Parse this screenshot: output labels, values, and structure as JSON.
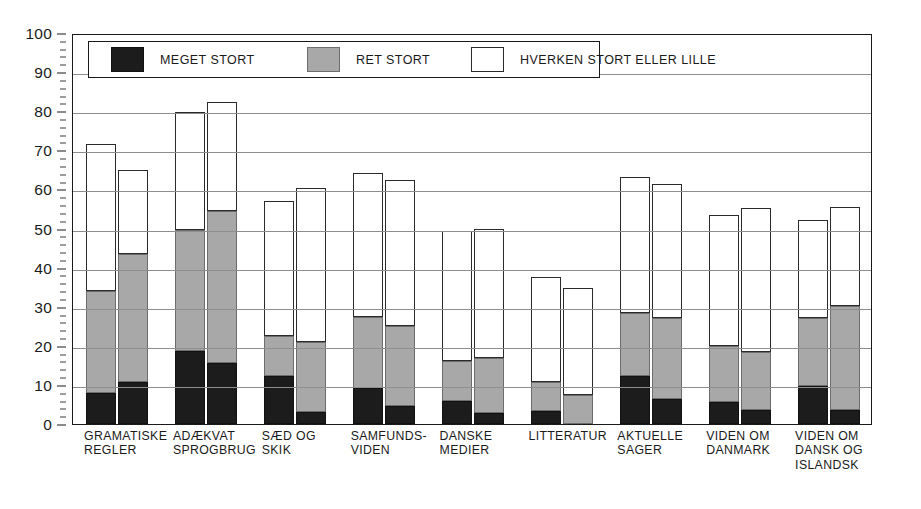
{
  "legend": {
    "items": [
      {
        "label": "MEGET STORT",
        "color": "#1c1c1c",
        "key": "black"
      },
      {
        "label": "RET STORT",
        "color": "#a8a8a8",
        "key": "gray"
      },
      {
        "label": "HVERKEN STORT ELLER LILLE",
        "color": "#ffffff",
        "key": "white"
      }
    ]
  },
  "axis": {
    "y_ticks": [
      0,
      10,
      20,
      30,
      40,
      50,
      60,
      70,
      80,
      90,
      100
    ],
    "y_minor_step": 2
  },
  "chart_data": {
    "type": "bar",
    "stacked": true,
    "grouped": true,
    "title": "",
    "subtitle": "",
    "xlabel": "",
    "ylabel": "",
    "ylim": [
      0,
      100
    ],
    "grid": true,
    "legend_position": "top-left-inside",
    "categories": [
      "GRAMATISKE REGLER",
      "ADÆKVAT SPROGBRUG",
      "SÆD OG SKIK",
      "SAMFUNDS-VIDEN",
      "DANSKE MEDIER",
      "LITTERATUR",
      "AKTUELLE SAGER",
      "VIDEN OM DANMARK",
      "VIDEN OM DANSK OG ISLANDSK"
    ],
    "category_label_lines": [
      [
        "GRAMATISKE",
        "REGLER"
      ],
      [
        "ADÆKVAT",
        "SPROGBRUG"
      ],
      [
        "SÆD OG",
        "SKIK"
      ],
      [
        "SAMFUNDS-",
        "VIDEN"
      ],
      [
        "DANSKE",
        "MEDIER"
      ],
      [
        "LITTERATUR"
      ],
      [
        "AKTUELLE",
        "SAGER"
      ],
      [
        "VIDEN OM",
        "DANMARK"
      ],
      [
        "VIDEN OM",
        "DANSK OG",
        "ISLANDSK"
      ]
    ],
    "series": [
      {
        "name": "MEGET STORT",
        "key": "black",
        "color": "#1c1c1c",
        "bar_a": [
          8.0,
          18.7,
          12.3,
          9.3,
          6.0,
          3.3,
          12.2,
          5.6,
          9.7
        ],
        "bar_b": [
          10.8,
          15.5,
          3.0,
          4.5,
          2.8,
          0.0,
          6.3,
          3.5,
          3.7
        ]
      },
      {
        "name": "RET STORT",
        "key": "gray",
        "color": "#a8a8a8",
        "bar_a": [
          26.0,
          31.0,
          10.2,
          18.0,
          10.0,
          7.4,
          16.1,
          14.4,
          17.3
        ],
        "bar_b": [
          32.7,
          39.0,
          18.0,
          20.5,
          14.0,
          7.5,
          20.7,
          14.8,
          26.5
        ]
      },
      {
        "name": "HVERKEN STORT ELLER LILLE",
        "key": "white",
        "color": "#ffffff",
        "bar_a": [
          37.5,
          30.0,
          34.5,
          37.0,
          33.3,
          27.0,
          34.9,
          33.5,
          25.3
        ],
        "bar_b": [
          21.5,
          27.8,
          39.3,
          37.5,
          33.2,
          27.3,
          34.3,
          36.9,
          25.3
        ]
      }
    ],
    "cumulative_tops": {
      "bar_a_black": [
        8.0,
        18.7,
        12.3,
        9.3,
        6.0,
        3.3,
        12.2,
        5.6,
        9.7
      ],
      "bar_a_gray": [
        34.0,
        49.7,
        22.5,
        27.3,
        16.0,
        10.7,
        28.3,
        20.0,
        27.0
      ],
      "bar_a_white": [
        71.5,
        79.7,
        57.0,
        64.3,
        49.3,
        37.7,
        63.2,
        53.5,
        52.3
      ],
      "bar_b_black": [
        10.8,
        15.5,
        3.0,
        4.5,
        2.8,
        0.0,
        6.3,
        3.5,
        3.7
      ],
      "bar_b_gray": [
        43.5,
        54.5,
        21.0,
        25.0,
        16.8,
        7.5,
        27.0,
        18.3,
        30.2
      ],
      "bar_b_white": [
        65.0,
        82.3,
        60.3,
        62.5,
        50.0,
        34.8,
        61.3,
        55.2,
        55.5
      ]
    }
  }
}
